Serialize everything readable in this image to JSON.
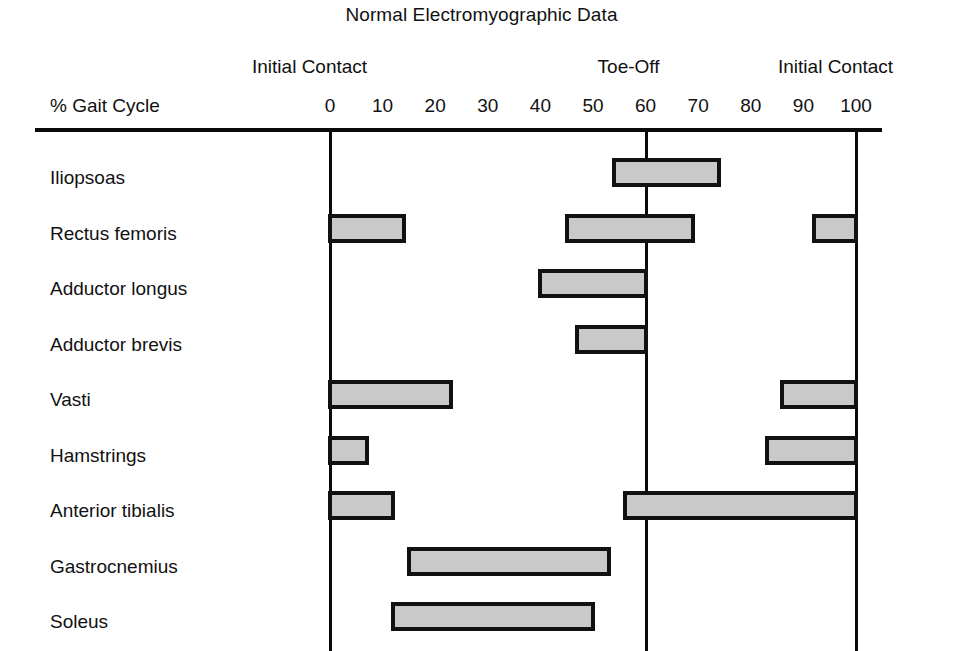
{
  "chart_data": {
    "type": "bar",
    "orientation": "horizontal-ranges",
    "title": "Normal Electromyographic Data",
    "xlabel": "% Gait Cycle",
    "ylabel": "",
    "xlim": [
      0,
      100
    ],
    "grid": false,
    "legend": "none",
    "tick_labels": [
      "0",
      "10",
      "20",
      "30",
      "40",
      "50",
      "60",
      "70",
      "80",
      "90",
      "100"
    ],
    "tick_values": [
      0,
      10,
      20,
      30,
      40,
      50,
      60,
      70,
      80,
      90,
      100
    ],
    "event_markers": [
      {
        "label": "Initial Contact",
        "value": 0
      },
      {
        "label": "Toe-Off",
        "value": 60
      },
      {
        "label": "Initial Contact",
        "value": 100
      }
    ],
    "categories": [
      "Iliopsoas",
      "Rectus femoris",
      "Adductor longus",
      "Adductor brevis",
      "Vasti",
      "Hamstrings",
      "Anterior tibialis",
      "Gastrocnemius",
      "Soleus"
    ],
    "series": [
      {
        "name": "Iliopsoas",
        "ranges": [
          [
            54,
            74
          ]
        ]
      },
      {
        "name": "Rectus femoris",
        "ranges": [
          [
            0,
            14
          ],
          [
            45,
            69
          ],
          [
            92,
            100
          ]
        ]
      },
      {
        "name": "Adductor longus",
        "ranges": [
          [
            40,
            60
          ]
        ]
      },
      {
        "name": "Adductor brevis",
        "ranges": [
          [
            47,
            60
          ]
        ]
      },
      {
        "name": "Vasti",
        "ranges": [
          [
            0,
            23
          ],
          [
            86,
            100
          ]
        ]
      },
      {
        "name": "Hamstrings",
        "ranges": [
          [
            0,
            7
          ],
          [
            83,
            100
          ]
        ]
      },
      {
        "name": "Anterior tibialis",
        "ranges": [
          [
            0,
            12
          ],
          [
            56,
            100
          ]
        ]
      },
      {
        "name": "Gastrocnemius",
        "ranges": [
          [
            15,
            53
          ]
        ]
      },
      {
        "name": "Soleus",
        "ranges": [
          [
            12,
            50
          ]
        ]
      }
    ],
    "colors": {
      "bar_fill": "#c9c9c9",
      "bar_stroke": "#111111",
      "axis": "#0a0a0a",
      "text": "#111111",
      "background": "#ffffff"
    }
  }
}
